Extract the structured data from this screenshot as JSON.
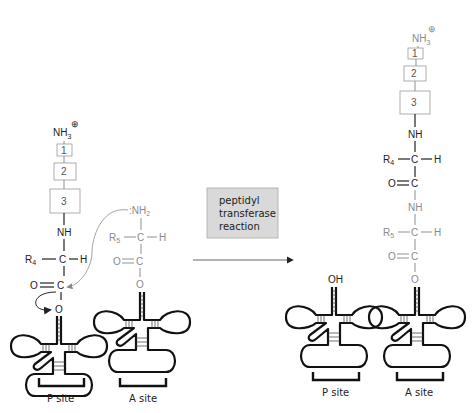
{
  "title": "Peptidyl transferase reaction",
  "reaction_label": [
    "peptidyl",
    "transferase",
    "reaction"
  ],
  "colors": {
    "dark": "#222222",
    "gray": "#8a8a8a",
    "reaction_box": "#d9d9d9"
  },
  "left": {
    "peptidyl_chain": {
      "n_terminus": "NH",
      "n_terminus_sub": "3",
      "charge": "⊕",
      "residues": [
        "1",
        "2",
        "3"
      ],
      "nh": "NH",
      "r_group": "R",
      "r_sub": "4",
      "alpha_c": "C",
      "h": "H",
      "carbonyl_o": "O",
      "carbonyl_c": "C",
      "ester_o": "O"
    },
    "aminoacyl": {
      "amine": ":NH",
      "amine_sub": "2",
      "r_group": "R",
      "r_sub": "5",
      "alpha_c": "C",
      "h": "H",
      "carbonyl_o": "O",
      "carbonyl_c": "C",
      "ester_o": "O"
    },
    "sites": [
      "P site",
      "A site"
    ]
  },
  "right": {
    "n_terminus": "NH",
    "n_terminus_sub": "3",
    "charge": "⊕",
    "residues": [
      "1",
      "2",
      "3"
    ],
    "nh1": "NH",
    "r4": "R",
    "r4_sub": "4",
    "c1": "C",
    "h1": "H",
    "o1": "O",
    "co1": "C",
    "nh2": "NH",
    "r5": "R",
    "r5_sub": "5",
    "c2": "C",
    "h2": "H",
    "o2": "O",
    "co2": "C",
    "ester_o": "O",
    "p_site_oh": "OH",
    "sites": [
      "P site",
      "A site"
    ]
  }
}
